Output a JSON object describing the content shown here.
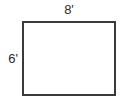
{
  "diagram": {
    "type": "rectangle-dimension-diagram",
    "shape": {
      "name": "rectangle",
      "fill_color": "#ffffff",
      "stroke_color": "#3a3a3a",
      "stroke_width_px": 2
    },
    "background_color": "#ffffff",
    "text_color": "#2b2b2b",
    "labels": {
      "width": "8'",
      "height": "6'"
    }
  },
  "chart_data": {
    "type": "diagram",
    "title": "",
    "shape": "rectangle",
    "dimensions": [
      {
        "side": "top",
        "label": "8'",
        "value": 8,
        "unit": "feet",
        "role": "width"
      },
      {
        "side": "left",
        "label": "6'",
        "value": 6,
        "unit": "feet",
        "role": "height"
      }
    ]
  }
}
